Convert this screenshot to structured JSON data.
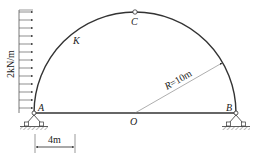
{
  "diagram": {
    "type": "three-hinged semicircular arch",
    "points": {
      "A": "A",
      "B": "B",
      "C": "C",
      "K": "K",
      "O": "O"
    },
    "load_label": "2kN/m",
    "radius_label": "R=10m",
    "dimension_label": "4m",
    "colors": {
      "line": "#333333",
      "thin": "#666666",
      "background": "#ffffff"
    }
  }
}
